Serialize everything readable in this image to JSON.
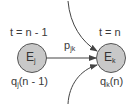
{
  "diagram": {
    "nodes": [
      {
        "id": "Ej",
        "letter": "E",
        "subscript": "j",
        "time_label": "t = n - 1",
        "q_letter": "q",
        "q_subscript": "j",
        "q_arg": "(n - 1)"
      },
      {
        "id": "Ek",
        "letter": "E",
        "subscript": "k",
        "time_label": "t = n",
        "q_letter": "q",
        "q_subscript": "k",
        "q_arg": "(n)"
      }
    ],
    "edge": {
      "from": "Ej",
      "to": "Ek",
      "letter": "p",
      "subscript": "jk"
    },
    "incoming_arrows": [
      "from-top",
      "from-bottom"
    ],
    "colors": {
      "node_fill": "#c8c8c8",
      "node_stroke": "#555555",
      "line": "#444444",
      "text": "#3a3a3a"
    }
  }
}
